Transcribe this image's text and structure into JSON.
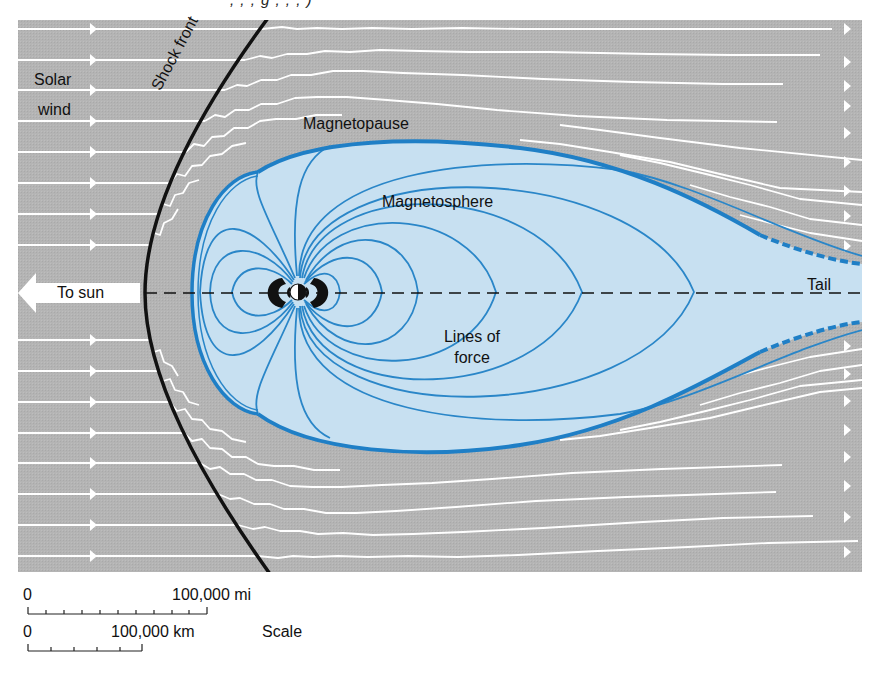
{
  "header_fragment": ",  ,  ,   g      ,   ,   ,   )",
  "labels": {
    "solar_wind_line1": "Solar",
    "solar_wind_line2": "wind",
    "shock_front": "Shock front",
    "magnetopause": "Magnetopause",
    "magnetosphere": "Magnetosphere",
    "to_sun": "To sun",
    "tail": "Tail",
    "lines_of_force_line1": "Lines of",
    "lines_of_force_line2": "force"
  },
  "scale": {
    "title": "Scale",
    "miles": {
      "start": "0",
      "end": "100,000 mi",
      "ticks": 10
    },
    "km": {
      "start": "0",
      "end": "100,000 km",
      "ticks": 5
    }
  },
  "colors": {
    "background_panel": "#b4b4b4",
    "magnetosphere_fill": "#c7e0f1",
    "field_line": "#2a86c8",
    "magnetopause_line": "#1f7fc6",
    "shock_front": "#111111",
    "solar_wind_streamline": "#ffffff"
  }
}
